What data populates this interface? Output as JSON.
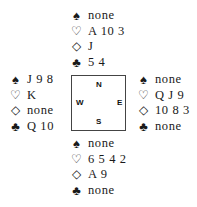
{
  "compass": {
    "north": "N",
    "south": "S",
    "east": "E",
    "west": "W"
  },
  "suit_icons": {
    "spades": "♠",
    "hearts": "♡",
    "diamonds": "◇",
    "clubs": "♣"
  },
  "hands": {
    "north": {
      "spades": "none",
      "hearts": "A 10 3",
      "diamonds": "J",
      "clubs": "5 4"
    },
    "west": {
      "spades": "J 9 8",
      "hearts": "K",
      "diamonds": "none",
      "clubs": "Q 10"
    },
    "east": {
      "spades": "none",
      "hearts": "Q J 9",
      "diamonds": "10 8 3",
      "clubs": "none"
    },
    "south": {
      "spades": "none",
      "hearts": "6 5 4 2",
      "diamonds": "A 9",
      "clubs": "none"
    }
  }
}
